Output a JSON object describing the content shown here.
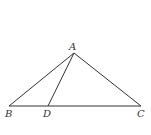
{
  "figure": {
    "type": "triangle",
    "stroke_color": "#333333",
    "points": {
      "A": {
        "label": "A",
        "x": 74,
        "y": 53
      },
      "B": {
        "label": "B",
        "x": 9,
        "y": 106
      },
      "C": {
        "label": "C",
        "x": 141,
        "y": 106
      },
      "D": {
        "label": "D",
        "x": 48,
        "y": 106
      }
    },
    "segments": [
      [
        "A",
        "B"
      ],
      [
        "A",
        "C"
      ],
      [
        "B",
        "C"
      ],
      [
        "A",
        "D"
      ]
    ]
  }
}
